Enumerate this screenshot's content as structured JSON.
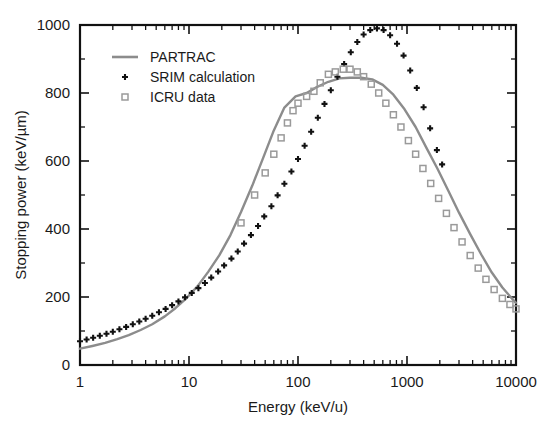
{
  "chart_data": {
    "type": "line",
    "title": "",
    "xlabel": "Energy (keV/u)",
    "ylabel": "Stopping power (keV/µm)",
    "xscale": "log",
    "yscale": "linear",
    "xlim": [
      1,
      10000
    ],
    "ylim": [
      0,
      1000
    ],
    "xticks": [
      1,
      10,
      100,
      1000,
      10000
    ],
    "xtick_labels": [
      "1",
      "10",
      "100",
      "1000",
      "10000"
    ],
    "yticks": [
      0,
      200,
      400,
      600,
      800,
      1000
    ],
    "ytick_labels": [
      "0",
      "200",
      "400",
      "600",
      "800",
      "1000"
    ],
    "ytick_minor_step": 100,
    "grid": false,
    "legend_position": "top-left",
    "series": [
      {
        "name": "PARTRAC",
        "marker": "line",
        "color": "#8c8c8c",
        "x": [
          1,
          1.3,
          1.7,
          2.2,
          2.8,
          3.6,
          4.6,
          6,
          7.5,
          9.5,
          12,
          15,
          19,
          24,
          30,
          38,
          48,
          60,
          75,
          95,
          120,
          150,
          190,
          240,
          300,
          380,
          480,
          600,
          750,
          950,
          1200,
          1500,
          1900,
          2400,
          3000,
          3800,
          4800,
          6000,
          7500,
          9500,
          10000
        ],
        "y": [
          48,
          56,
          65,
          76,
          88,
          103,
          120,
          143,
          167,
          197,
          232,
          274,
          323,
          382,
          450,
          527,
          610,
          690,
          757,
          790,
          800,
          818,
          833,
          843,
          845,
          845,
          840,
          824,
          795,
          752,
          700,
          640,
          578,
          512,
          448,
          385,
          325,
          272,
          228,
          190,
          183
        ]
      },
      {
        "name": "SRIM calculation",
        "marker": "plus",
        "color": "#111111",
        "x": [
          1,
          1.15,
          1.32,
          1.52,
          1.75,
          2.0,
          2.3,
          2.65,
          3.05,
          3.5,
          4.0,
          4.6,
          5.3,
          6.1,
          7.0,
          8.0,
          9.2,
          10.6,
          12.2,
          14,
          16,
          18.5,
          21,
          24.5,
          28,
          32,
          37,
          43,
          49,
          57,
          65,
          75,
          87,
          100,
          115,
          132,
          152,
          175,
          200,
          230,
          265,
          305,
          350,
          400,
          460,
          530,
          610,
          700,
          810,
          930,
          1070,
          1230,
          1420,
          1630,
          1880,
          2100
        ],
        "y": [
          70,
          75,
          80,
          86,
          92,
          98,
          105,
          112,
          120,
          128,
          136,
          145,
          155,
          165,
          176,
          187,
          199,
          212,
          226,
          241,
          257,
          275,
          293,
          313,
          334,
          357,
          382,
          409,
          437,
          467,
          499,
          533,
          569,
          606,
          645,
          686,
          727,
          768,
          808,
          848,
          885,
          920,
          950,
          972,
          985,
          990,
          985,
          970,
          945,
          910,
          866,
          815,
          758,
          696,
          632,
          590
        ]
      },
      {
        "name": "ICRU data",
        "marker": "square-open",
        "color": "#9a9a9a",
        "x": [
          30,
          40,
          50,
          60,
          70,
          80,
          90,
          100,
          120,
          140,
          160,
          190,
          220,
          260,
          300,
          350,
          400,
          470,
          550,
          640,
          750,
          880,
          1030,
          1200,
          1400,
          1650,
          1950,
          2300,
          2700,
          3200,
          3800,
          4500,
          5300,
          6300,
          7500,
          8800,
          10000
        ],
        "y": [
          418,
          500,
          565,
          620,
          668,
          712,
          748,
          770,
          790,
          805,
          830,
          855,
          862,
          870,
          870,
          862,
          848,
          826,
          800,
          770,
          736,
          700,
          660,
          620,
          578,
          534,
          490,
          446,
          404,
          362,
          322,
          285,
          252,
          222,
          196,
          178,
          165
        ]
      }
    ]
  },
  "legend": {
    "entries": [
      {
        "label": "PARTRAC",
        "marker": "line"
      },
      {
        "label": "SRIM calculation",
        "marker": "plus"
      },
      {
        "label": "ICRU data",
        "marker": "square-open"
      }
    ]
  }
}
